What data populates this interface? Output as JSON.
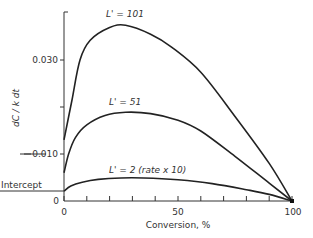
{
  "chart_data": {
    "type": "line",
    "title": "",
    "xlabel": "Conversion, %",
    "ylabel": "dC / k dt",
    "xlim": [
      0,
      100
    ],
    "ylim": [
      0,
      0.04
    ],
    "x_ticks": [
      0,
      10,
      20,
      30,
      40,
      50,
      60,
      70,
      80,
      90,
      100
    ],
    "x_tick_labels": [
      "0",
      "50",
      "100"
    ],
    "y_ticks": [
      0,
      0.01,
      0.02,
      0.03
    ],
    "y_tick_labels": [
      "0",
      "0.010",
      "0.030"
    ],
    "grid": false,
    "annotations": [
      "Intercept"
    ],
    "intercept_value": 0.0021,
    "series": [
      {
        "name": "L' = 101",
        "label": "L' = 101",
        "x": [
          0,
          3.5,
          7,
          11.5,
          20,
          27,
          38,
          47,
          60,
          75,
          90,
          100
        ],
        "values": [
          0.013,
          0.0215,
          0.03,
          0.0342,
          0.0369,
          0.0374,
          0.0355,
          0.0328,
          0.0274,
          0.018,
          0.008,
          0.0
        ]
      },
      {
        "name": "L' = 51",
        "label": "L' = 51",
        "x": [
          0,
          2,
          5,
          10,
          18,
          27,
          38,
          50,
          60,
          75,
          90,
          100
        ],
        "values": [
          0.006,
          0.01,
          0.0135,
          0.0162,
          0.0182,
          0.0189,
          0.0186,
          0.0172,
          0.0149,
          0.0095,
          0.0038,
          0.0
        ]
      },
      {
        "name": "L' = 2 (rate x 10)",
        "label": "L' = 2 (rate x 10)",
        "x": [
          0,
          3,
          8,
          15,
          25,
          35,
          50,
          65,
          80,
          90,
          100
        ],
        "values": [
          0.0021,
          0.0032,
          0.004,
          0.0046,
          0.0049,
          0.0049,
          0.0045,
          0.0037,
          0.0024,
          0.0014,
          0.0
        ]
      }
    ]
  },
  "labels": {
    "curve_101": "L' = 101",
    "curve_51": "L' = 51",
    "curve_2": "L' = 2  (rate x 10)",
    "intercept": "Intercept",
    "x_axis_title": "Conversion, %",
    "y_axis_title": "dC / k dt",
    "x_tick_0": "0",
    "x_tick_50": "50",
    "x_tick_100": "100",
    "y_tick_0": "0",
    "y_tick_010": "0.010",
    "y_tick_030": "0.030"
  }
}
